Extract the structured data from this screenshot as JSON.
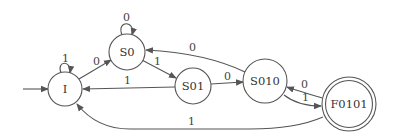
{
  "diagram": {
    "type": "finite-state-automaton",
    "colors": {
      "stroke": "#555555",
      "text": "#333333",
      "background": "#ffffff"
    },
    "states": [
      {
        "id": "I",
        "label": "I",
        "initial": true,
        "accepting": false
      },
      {
        "id": "S0",
        "label": "S0",
        "initial": false,
        "accepting": false
      },
      {
        "id": "S01",
        "label": "S01",
        "initial": false,
        "accepting": false
      },
      {
        "id": "S010",
        "label": "S010",
        "initial": false,
        "accepting": false
      },
      {
        "id": "F0101",
        "label": "F0101",
        "initial": false,
        "accepting": true
      }
    ],
    "transitions": [
      {
        "from": "I",
        "to": "I",
        "label": "1"
      },
      {
        "from": "I",
        "to": "S0",
        "label": "0"
      },
      {
        "from": "S0",
        "to": "S0",
        "label": "0"
      },
      {
        "from": "S0",
        "to": "S01",
        "label": "1"
      },
      {
        "from": "S01",
        "to": "I",
        "label": "1"
      },
      {
        "from": "S01",
        "to": "S010",
        "label": "0"
      },
      {
        "from": "S010",
        "to": "S0",
        "label": "0"
      },
      {
        "from": "S010",
        "to": "F0101",
        "label": "1"
      },
      {
        "from": "F0101",
        "to": "S010",
        "label": "0"
      },
      {
        "from": "F0101",
        "to": "I",
        "label": "1"
      }
    ]
  }
}
